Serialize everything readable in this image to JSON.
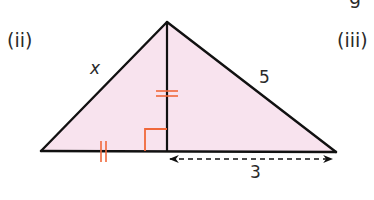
{
  "figure": {
    "part_left": "(ii)",
    "part_right": "(iii)",
    "top_right_partial_glyph": "g"
  },
  "triangle": {
    "fill_color": "#f8e3ee",
    "stroke_color": "#111111",
    "mark_color": "#f0683a",
    "vertices": {
      "apex": [
        167,
        22
      ],
      "left": [
        41,
        151
      ],
      "right": [
        336,
        152
      ],
      "altitude_foot": [
        167,
        151
      ]
    },
    "labels": {
      "left_side": "x",
      "right_side": "5",
      "base_segment": "3"
    },
    "marks": {
      "right_angle": "right-angle at altitude foot",
      "equal_tick_altitude": "double tick on altitude",
      "equal_tick_left_base": "double tick on left base segment"
    },
    "dimension_arrow": "dashed double-headed arrow from altitude foot to right vertex"
  }
}
